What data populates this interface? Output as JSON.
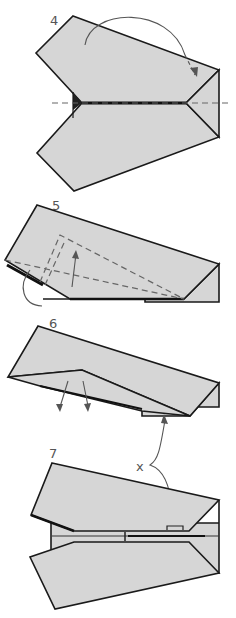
{
  "steps": [
    {
      "number": "4",
      "instruction": "fold top wing over along center dashed line"
    },
    {
      "number": "5",
      "instruction": "fold wing up along dashed lines"
    },
    {
      "number": "6",
      "instruction": "unfold wings down"
    },
    {
      "number": "7",
      "instruction": "finished plane"
    }
  ],
  "callout": {
    "label": "x"
  },
  "colors": {
    "paper": "#d6d6d6",
    "outline": "#1a1a1a",
    "dashed": "#666666",
    "label": "#555555"
  }
}
